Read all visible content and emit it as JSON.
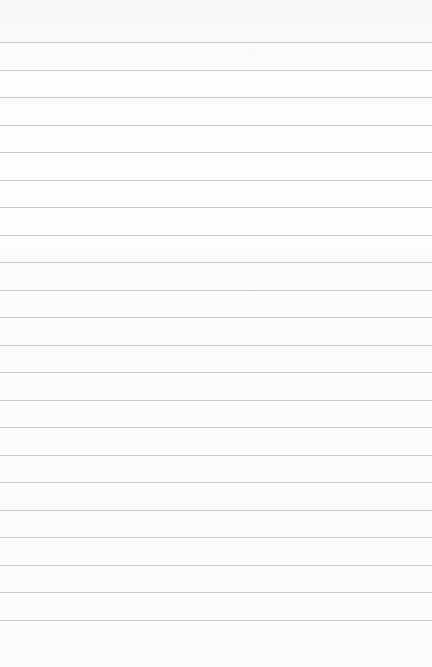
{
  "image": {
    "subject": "lined notebook paper",
    "background_color": "#fbfbfb",
    "line_color": "#c9c9c9",
    "line_count": 22,
    "first_line_y": 42,
    "line_spacing": 27.5
  }
}
